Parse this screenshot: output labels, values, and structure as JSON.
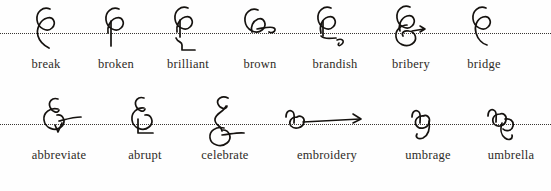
{
  "page": {
    "background_color": "#fefefe",
    "ink_color": "#15120f",
    "text_color": "#2d2a26",
    "baseline_style": "dotted"
  },
  "rows": [
    {
      "id": "row-0",
      "baseline_y": 33,
      "entries": [
        {
          "word": "break",
          "glyph": "loop-stem",
          "x": 14,
          "width": 64
        },
        {
          "word": "broken",
          "glyph": "loop-downstroke",
          "x": 81,
          "width": 70
        },
        {
          "word": "brilliant",
          "glyph": "loop-hook-right-angle",
          "x": 152,
          "width": 72
        },
        {
          "word": "brown",
          "glyph": "loop-horizontal-curl",
          "x": 226,
          "width": 68
        },
        {
          "word": "brandish",
          "glyph": "loop-s-tail",
          "x": 297,
          "width": 76
        },
        {
          "word": "bribery",
          "glyph": "loop-double-coil",
          "x": 376,
          "width": 70
        },
        {
          "word": "bridge",
          "glyph": "loop-descender",
          "x": 450,
          "width": 68
        }
      ]
    },
    {
      "id": "row-1",
      "baseline_y": 29,
      "entries": [
        {
          "word": "abbreviate",
          "glyph": "loop-check-dash",
          "x": 14,
          "width": 90
        },
        {
          "word": "abrupt",
          "glyph": "loop-angle-foot",
          "x": 108,
          "width": 74
        },
        {
          "word": "celebrate",
          "glyph": "tall-curve-over-circle",
          "x": 184,
          "width": 82
        },
        {
          "word": "embroidery",
          "glyph": "en-loop-long-dash",
          "x": 272,
          "width": 110
        },
        {
          "word": "umbrage",
          "glyph": "en-loop-descender",
          "x": 386,
          "width": 84
        },
        {
          "word": "umbrella",
          "glyph": "en-loop-hook-tail",
          "x": 472,
          "width": 78
        }
      ]
    }
  ]
}
